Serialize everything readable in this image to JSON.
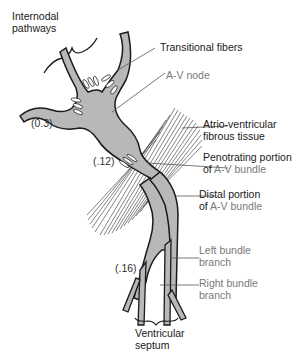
{
  "figure": {
    "colors": {
      "tissue_fill": "#b8b8b8",
      "outline": "#1a1a1a",
      "label_black": "#1a1a1a",
      "label_gray": "#7a7a7a",
      "leader_line": "#555555"
    }
  },
  "labels": {
    "internodal_line1": "Internodal",
    "internodal_line2": "pathways",
    "transitional": "Transitional fibers",
    "av_node": "A-V node",
    "fibrous_line1": "Atrio-ventricular",
    "fibrous_line2": "fibrous tissue",
    "penetrating_line1": "Penotrating portion",
    "penetrating_of": "of ",
    "penetrating_bundle": "A-V bundle",
    "distal_line1": "Distal portion",
    "distal_of": "of ",
    "distal_bundle": "A-V bundle",
    "left_line1": "Left bundle",
    "left_line2": "branch",
    "right_line1": "Right bundle",
    "right_line2": "branch",
    "septum_line1": "Ventricular",
    "septum_line2": "septum"
  },
  "timings": {
    "node": "(0.3)",
    "penetrating": "(.12)",
    "branches": "(.16)"
  }
}
